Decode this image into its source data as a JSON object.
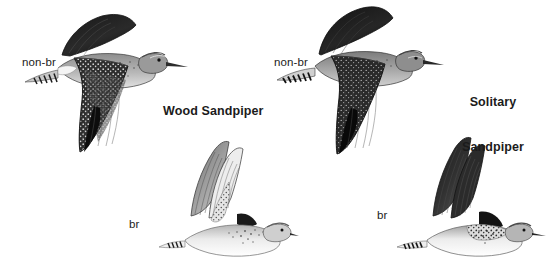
{
  "plate": {
    "title": "Wood Sandpiper and Solitary Sandpiper in flight",
    "background_color": "#ffffff",
    "ink_color": "#1b1b1b",
    "width": 551,
    "height": 277
  },
  "species": [
    {
      "id": "wood-sandpiper",
      "name": "Wood Sandpiper",
      "side": "left",
      "figures": [
        {
          "id": "wood-nonbr",
          "plumage_label": "non-br",
          "plumage": "non-breeding",
          "tone": "dark"
        },
        {
          "id": "wood-br",
          "plumage_label": "br",
          "plumage": "breeding",
          "tone": "pale"
        }
      ]
    },
    {
      "id": "solitary-sandpiper",
      "name": "Solitary Sandpiper",
      "name_line1": "Solitary",
      "name_line2": "Sandpiper",
      "side": "right",
      "figures": [
        {
          "id": "sol-nonbr",
          "plumage_label": "non-br",
          "plumage": "non-breeding",
          "tone": "dark"
        },
        {
          "id": "sol-br",
          "plumage_label": "br",
          "plumage": "breeding",
          "tone": "pale"
        }
      ]
    }
  ],
  "labels": {
    "wood_nonbr": "non-br",
    "wood_species": "Wood Sandpiper",
    "wood_br": "br",
    "solitary_nonbr": "non-br",
    "solitary_species_line1": "Solitary",
    "solitary_species_line2": "Sandpiper",
    "solitary_br": "br"
  },
  "icons": {
    "bird_dark": "bird-flight-dark-icon",
    "bird_pale": "bird-flight-pale-icon"
  }
}
